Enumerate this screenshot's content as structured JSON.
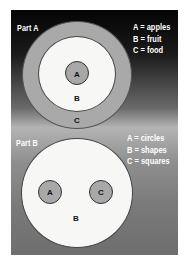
{
  "part_a": {
    "title": "Part A",
    "legend": [
      "A = apples",
      "B = fruit",
      "C = food"
    ],
    "circles": {
      "inner": "A",
      "middle": "B",
      "outer": "C"
    }
  },
  "part_b": {
    "title": "Part B",
    "legend": [
      "A = circles",
      "B = shapes",
      "C = squares"
    ],
    "circles": {
      "left": "A",
      "right": "C",
      "container": "B"
    }
  },
  "colors": {
    "panel_top": "#050505",
    "panel_mid": "#b4b4b4",
    "panel_bottom": "#6e6e6e",
    "outer_ring": "#a9a9a9",
    "white_circle": "#f7f7f5",
    "small_circle": "#a8a8a8"
  }
}
